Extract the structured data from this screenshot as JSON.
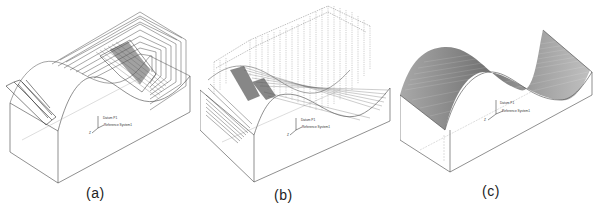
{
  "figure": {
    "panels": [
      {
        "id": "a",
        "caption": "(a)",
        "description": "Roughing toolpath over saddle-shaped part",
        "triad_labels": {
          "datum": "Datum P1",
          "ref": "Reference System1",
          "axis": "Z"
        }
      },
      {
        "id": "b",
        "caption": "(b)",
        "description": "Semi-finishing toolpath with vertical plunge lines",
        "triad_labels": {
          "datum": "Datum P1",
          "ref": "Reference System1",
          "axis": "Z"
        }
      },
      {
        "id": "c",
        "caption": "(c)",
        "description": "Finished sinusoidal saddle surface",
        "triad_labels": {
          "datum": "Datum P1",
          "ref": "Reference System1",
          "axis": "Z"
        }
      }
    ],
    "colors": {
      "line": "#3a3a3a",
      "dense": "#4a4a4a",
      "light": "#8a8a8a",
      "background": "#ffffff"
    }
  }
}
